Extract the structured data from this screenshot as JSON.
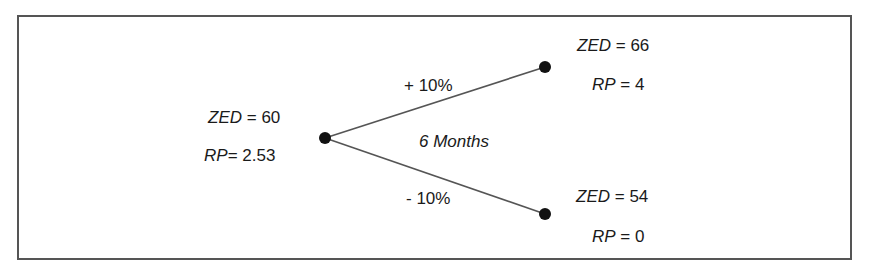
{
  "diagram": {
    "type": "binomial-tree",
    "period_label": "6 Months",
    "root": {
      "zed_label": "ZED",
      "zed_value": "60",
      "rp_label": "RP",
      "rp_value": "2.53"
    },
    "up": {
      "edge_label": "+ 10%",
      "zed_label": "ZED",
      "zed_value": "66",
      "rp_label": "RP",
      "rp_value": "4"
    },
    "down": {
      "edge_label": "- 10%",
      "zed_label": "ZED",
      "zed_value": "54",
      "rp_label": "RP",
      "rp_value": "0"
    },
    "colors": {
      "line": "#555555",
      "node": "#111111",
      "text": "#1a1a1a"
    }
  }
}
